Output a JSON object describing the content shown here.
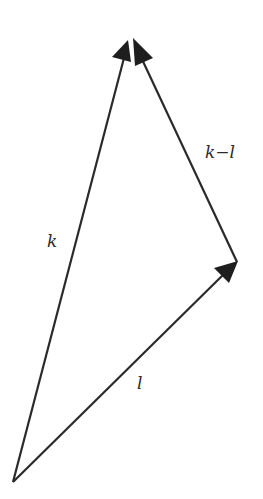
{
  "diagram": {
    "type": "vector-triangle",
    "vertices": {
      "origin": {
        "x": 13,
        "y": 482
      },
      "l_tip": {
        "x": 237,
        "y": 262
      },
      "k_tip": {
        "x": 130,
        "y": 38
      }
    },
    "vectors": [
      {
        "id": "k",
        "label": "k",
        "from": "origin",
        "to": "k_tip"
      },
      {
        "id": "l",
        "label": "l",
        "from": "origin",
        "to": "l_tip"
      },
      {
        "id": "k_minus_l",
        "label": "k−l",
        "from": "l_tip",
        "to": "k_tip"
      }
    ],
    "labels": {
      "k": "k",
      "l": "l",
      "k_minus_l": "k−l"
    },
    "colors": {
      "stroke": "#2a2a2a",
      "background": "#ffffff"
    }
  }
}
